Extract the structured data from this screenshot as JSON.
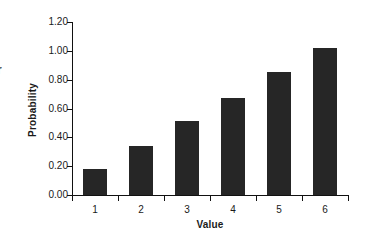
{
  "figure": {
    "background_color": "#ffffff",
    "bar_color": "#262626",
    "axis_color": "#111111",
    "edge_fragment_text": "r"
  },
  "chart_data": {
    "type": "bar",
    "title": "",
    "xlabel": "Value",
    "ylabel": "Probability",
    "categories": [
      "1",
      "2",
      "3",
      "4",
      "5",
      "6"
    ],
    "values": [
      0.18,
      0.34,
      0.51,
      0.67,
      0.85,
      1.02
    ],
    "ylim": [
      0.0,
      1.2
    ],
    "ytick_values": [
      0.0,
      0.2,
      0.4,
      0.6,
      0.8,
      1.0,
      1.2
    ],
    "ytick_labels": [
      "0.00",
      "0.20",
      "0.40",
      "0.60",
      "0.80",
      "1.00",
      "1.20"
    ],
    "grid": false,
    "legend": null,
    "legend_position": "none",
    "annotations": []
  }
}
